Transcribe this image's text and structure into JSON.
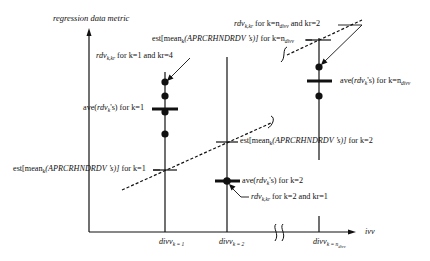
{
  "axes": {
    "y_label": "regression data metric",
    "x_label": "ivv",
    "x_ticks": [
      {
        "base": "divv",
        "sub": "k = 1"
      },
      {
        "base": "divv",
        "sub": "k = 2"
      },
      {
        "base": "divv",
        "sub": "k = n",
        "subsub": "divv"
      }
    ]
  },
  "annotations": {
    "rdv_k1": {
      "base": "rdv",
      "sub": "k,kr",
      "text": " for k=1 and kr=4"
    },
    "ave_k1": {
      "pre": "ave(",
      "var": "rdv",
      "sub": "k",
      "post": "'s) for k=1"
    },
    "est_k1": {
      "pre": "est[mean",
      "sub": "k",
      "var": "(APRCRHNDRDV ’s)]",
      "post": " for k=1"
    },
    "est_k2": {
      "pre": "est[mean",
      "sub": "k",
      "var": "(APRCRHNDRDV ’s)]",
      "post": " for k=2"
    },
    "ave_k2": {
      "pre": "ave(",
      "var": "rdv",
      "sub": "k",
      "post": "'s) for k=2"
    },
    "rdv_k2": {
      "base": "rdv",
      "sub": "k,kr",
      "text": " for k=2 and kr=1"
    },
    "rdv_kn": {
      "base": "rdv",
      "sub": "k,kr",
      "text1": "  for k=n",
      "subn": "divv",
      "text2": " and kr=2"
    },
    "est_kn": {
      "pre": "est[mean",
      "sub": "k",
      "var": "(APRCRHNDRDV ’s)]",
      "post": " for k=n",
      "subn": "divv"
    },
    "ave_kn": {
      "pre": "ave(",
      "var": "rdv",
      "sub": "k",
      "post": "'s) for k=n",
      "subn": "divv"
    }
  }
}
